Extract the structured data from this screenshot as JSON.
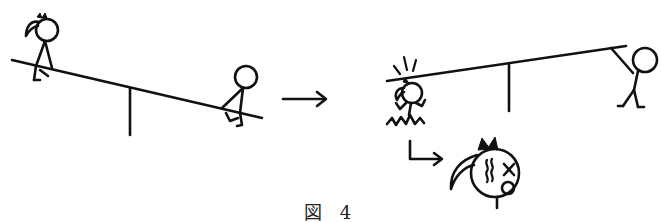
{
  "figure": {
    "caption": "図 4",
    "ink_color": "#111111",
    "background": "#ffffff"
  },
  "panels": {
    "before": {
      "description": "Seesaw tilted down to the right; girl with ponytail sits on high left end, boy sits on low right end",
      "seesaw": {
        "left_end": [
          12,
          60
        ],
        "right_end": [
          262,
          118
        ],
        "fulcrum_x": 130
      },
      "characters": [
        "girl-sitting-high",
        "boy-sitting-low"
      ]
    },
    "transition_arrow": {
      "symbol": "→"
    },
    "after": {
      "description": "Seesaw tilted up to the right; boy hanging from high right end, girl falls off left end hitting head",
      "seesaw": {
        "left_end": [
          387,
          81
        ],
        "right_end": [
          626,
          46
        ],
        "fulcrum_x": 509
      },
      "characters": [
        "girl-falling-hit",
        "boy-standing-holding-bar"
      ]
    },
    "closeup": {
      "description": "Enlarged dizzy girl's face with wavy lines, X eye and open mouth",
      "arrow": "L-shaped arrow pointing right"
    }
  }
}
